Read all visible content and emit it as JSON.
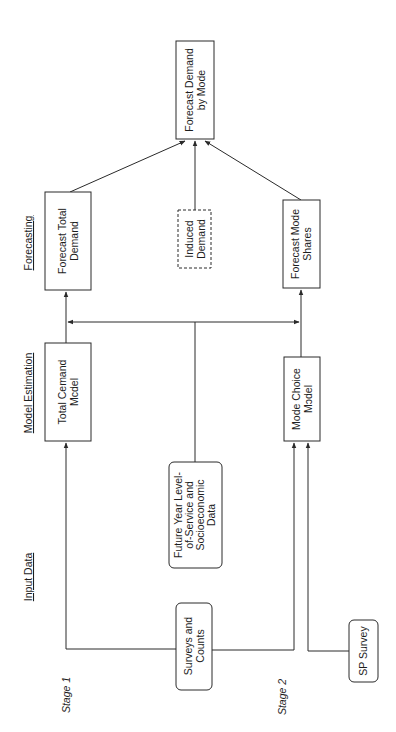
{
  "diagram": {
    "type": "flowchart",
    "orientation": "rotated-90-ccw",
    "column_headers": {
      "forecasting": "Forecasting",
      "model_estimation": "Model Estimation",
      "input_data": "Input Data"
    },
    "stages": {
      "stage1": "Stage 1",
      "stage2": "Stage 2"
    },
    "nodes": {
      "forecast_demand_by_mode": {
        "line1": "Forecast Demand",
        "line2": "by Mode"
      },
      "forecast_total_demand": {
        "line1": "Forecast Total",
        "line2": "Demand"
      },
      "induced_demand": {
        "line1": "Induced",
        "line2": "Demand"
      },
      "forecast_mode_shares": {
        "line1": "Forecast Mode",
        "line2": "Shares"
      },
      "total_demand_model": {
        "line1": "Total Cemand",
        "line2": "Mcdel"
      },
      "mode_choice_model": {
        "line1": "Mode Choice",
        "line2": "Mɔdel"
      },
      "future_year_data": {
        "line1": "Future Year Level-",
        "line2": "of-Service and",
        "line3": "Socioeconomic",
        "line4": "Data"
      },
      "surveys_and_counts": {
        "line1": "Surveys and",
        "line2": "Counts"
      },
      "sp_survey": {
        "line1": "SP Survey"
      }
    },
    "edges": [
      {
        "from": "surveys_and_counts",
        "to": "total_demand_model"
      },
      {
        "from": "surveys_and_counts",
        "to": "mode_choice_model"
      },
      {
        "from": "sp_survey",
        "to": "mode_choice_model"
      },
      {
        "from": "total_demand_model",
        "to": "forecast_total_demand"
      },
      {
        "from": "future_year_data",
        "to": "forecast_total_demand"
      },
      {
        "from": "future_year_data",
        "to": "forecast_mode_shares"
      },
      {
        "from": "mode_choice_model",
        "to": "forecast_mode_shares"
      },
      {
        "from": "forecast_total_demand",
        "to": "forecast_demand_by_mode"
      },
      {
        "from": "induced_demand",
        "to": "forecast_demand_by_mode"
      },
      {
        "from": "forecast_mode_shares",
        "to": "forecast_demand_by_mode"
      }
    ],
    "colors": {
      "stroke": "#2a2a2a",
      "text": "#1e1e1e",
      "background": "#ffffff"
    }
  }
}
